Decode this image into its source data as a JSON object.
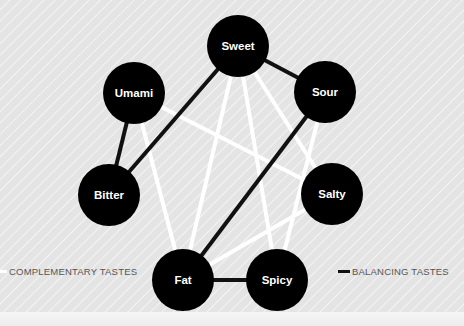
{
  "diagram": {
    "nodes": [
      {
        "id": "sweet",
        "label": "Sweet",
        "cx": 238,
        "cy": 46
      },
      {
        "id": "umami",
        "label": "Umami",
        "cx": 134,
        "cy": 93
      },
      {
        "id": "sour",
        "label": "Sour",
        "cx": 325,
        "cy": 92
      },
      {
        "id": "bitter",
        "label": "Bitter",
        "cx": 109,
        "cy": 195
      },
      {
        "id": "salty",
        "label": "Salty",
        "cx": 332,
        "cy": 194
      },
      {
        "id": "fat",
        "label": "Fat",
        "cx": 183,
        "cy": 280
      },
      {
        "id": "spicy",
        "label": "Spicy",
        "cx": 277,
        "cy": 280
      }
    ],
    "node_radius": 31,
    "edges": {
      "complementary": [
        [
          "sweet",
          "fat"
        ],
        [
          "sweet",
          "spicy"
        ],
        [
          "sweet",
          "salty"
        ],
        [
          "umami",
          "salty"
        ],
        [
          "umami",
          "fat"
        ],
        [
          "sour",
          "spicy"
        ],
        [
          "salty",
          "fat"
        ]
      ],
      "balancing": [
        [
          "sweet",
          "sour"
        ],
        [
          "sweet",
          "bitter"
        ],
        [
          "umami",
          "bitter"
        ],
        [
          "sour",
          "fat"
        ],
        [
          "fat",
          "spicy"
        ]
      ]
    },
    "colors": {
      "node": "#000000",
      "node_text": "#ffffff",
      "complementary": "#ffffff",
      "balancing": "#111111",
      "background": "#e6e6e6"
    }
  },
  "legend": {
    "complementary_label": "COMPLEMENTARY TASTES",
    "balancing_label": "BALANCING TASTES"
  }
}
